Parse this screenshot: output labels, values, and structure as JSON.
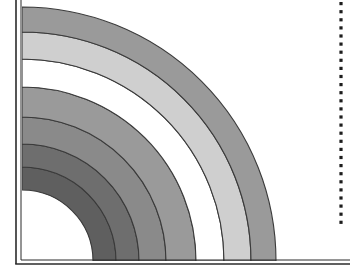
{
  "figure": {
    "width": 350,
    "height": 273,
    "background_color": "#ffffff"
  },
  "chart_data": {
    "type": "area",
    "subtitle": "",
    "xlabel": "",
    "ylabel": "",
    "grid": false,
    "legend_position": "none",
    "origin": {
      "x": 22,
      "y": 261
    },
    "xlim": [
      0,
      350
    ],
    "ylim": [
      0,
      273
    ],
    "axis_tick_labels_x": [],
    "axis_tick_labels_y": [],
    "annotations": [],
    "band_outline_color": "#3a3a3a",
    "band_outline_width": 1.1,
    "bands": [
      {
        "name": "band-1-innermost-dark",
        "r_inner": 71,
        "r_outer": 94,
        "fill": "#5f5f5f",
        "shade_label": "darkest"
      },
      {
        "name": "band-2-dark",
        "r_inner": 94,
        "r_outer": 117,
        "fill": "#6e6e6e",
        "shade_label": "dark"
      },
      {
        "name": "band-3-medium-dark",
        "r_inner": 117,
        "r_outer": 144,
        "fill": "#8a8a8a",
        "shade_label": "medium-dark"
      },
      {
        "name": "band-4-medium",
        "r_inner": 144,
        "r_outer": 174,
        "fill": "#9a9a9a",
        "shade_label": "medium"
      },
      {
        "name": "band-5-white",
        "r_inner": 174,
        "r_outer": 202,
        "fill": "#ffffff",
        "shade_label": "white"
      },
      {
        "name": "band-6-light",
        "r_inner": 202,
        "r_outer": 229,
        "fill": "#cfcfcf",
        "shade_label": "light"
      },
      {
        "name": "band-7-outermost-medium",
        "r_inner": 229,
        "r_outer": 254,
        "fill": "#9a9a9a",
        "shade_label": "medium"
      }
    ],
    "axis_frame": {
      "name": "double-line-axis-frame",
      "color": "#2b2b2b",
      "outer_line_width": 1.6,
      "inner_line_width": 1.0,
      "x_axis_y_outer": 264,
      "x_axis_y_inner": 260,
      "y_axis_x_outer": 16,
      "y_axis_x_inner": 21,
      "x_axis_extent": [
        16,
        350
      ],
      "y_axis_extent": [
        0,
        264
      ]
    },
    "reference_line": {
      "name": "vertical-dotted-reference-line",
      "orientation": "vertical",
      "x": 341,
      "y_start": 2,
      "y_end": 226,
      "color": "#1d1d1d",
      "style": "dotted",
      "dot_size": 3.2,
      "dot_spacing": 8.1
    }
  }
}
